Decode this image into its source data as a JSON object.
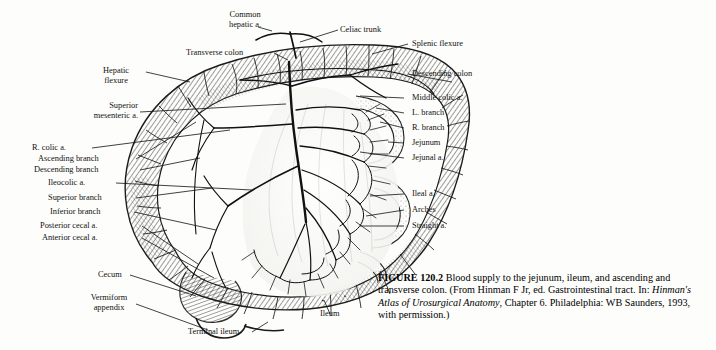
{
  "figure": {
    "number": "FIGURE 120.2",
    "caption_main": " Blood supply to the jejunum, ileum, and ascending and transverse colon. (From Hinman F Jr, ed. Gastrointestinal tract. In: ",
    "caption_italic": "Hinman's Atlas of Urosurgical Anatomy",
    "caption_end": ", Chapter 6. Philadelphia: WB Saunders, 1993, with permission.)"
  },
  "labels": {
    "common_hepatic": "Common\nhepatic a.",
    "celiac_trunk": "Celiac trunk",
    "splenic_flexure": "Splenic flexure",
    "transverse_colon": "Transverse colon",
    "descending_colon": "Descending colon",
    "hepatic_flexure": "Hepatic\nflexure",
    "middle_colic": "Middle colic a.",
    "l_branch": "L. branch",
    "superior_mesenteric": "Superior\nmesenteric a.",
    "r_branch": "R. branch",
    "jejunum": "Jejunum",
    "jejunal": "Jejunal a.",
    "r_colic": "R. colic a.",
    "ascending_branch": "Ascending branch",
    "descending_branch": "Descending branch",
    "ileocolic": "Ileocolic a.",
    "superior_branch": "Superior branch",
    "inferior_branch": "Inferior branch",
    "posterior_cecal": "Posterior cecal a.",
    "anterior_cecal": "Anterior cecal a.",
    "ileal": "Ileal a.",
    "arches": "Arches",
    "straight": "Straight a.",
    "cecum": "Cecum",
    "vermiform_appendix": "Vermiform\nappendix",
    "terminal_ileum": "Terminal ileum",
    "ileum": "Ileum"
  },
  "colors": {
    "ink": "#111111",
    "paper": "#fdfdfb"
  }
}
